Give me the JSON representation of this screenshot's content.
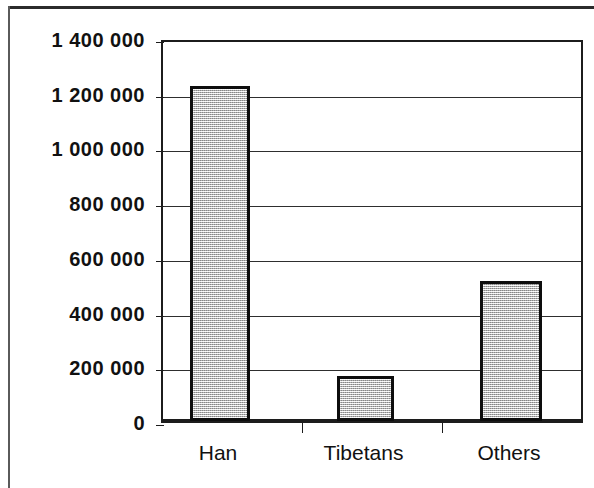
{
  "chart_data": {
    "type": "bar",
    "title": "",
    "subtitle": "",
    "xlabel": "",
    "ylabel": "",
    "categories": [
      "Han",
      "Tibetans",
      "Others"
    ],
    "values": [
      1225000,
      165000,
      510000
    ],
    "series": [
      {
        "name": "Population",
        "values": [
          1225000,
          165000,
          510000
        ]
      }
    ],
    "ylim": [
      0,
      1400000
    ],
    "ytick_values": [
      0,
      200000,
      400000,
      600000,
      800000,
      1000000,
      1200000,
      1400000
    ],
    "ytick_labels": [
      "0",
      "200 000",
      "400 000",
      "600 000",
      "800 000",
      "1 000 000",
      "1 200 000",
      "1 400 000"
    ],
    "grid": true,
    "grid_axis": "y",
    "legend": false,
    "legend_position": "none",
    "annotations": [],
    "bar_fill_color": "#c6c6c6",
    "bar_border_color": "#0d0d0d",
    "axis_color": "#1c1c1c",
    "grid_color": "#2e2e2e",
    "background_color": "#ffffff"
  }
}
